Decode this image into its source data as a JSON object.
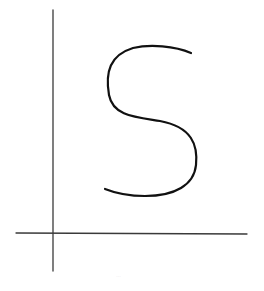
{
  "diagram": {
    "type": "sketch",
    "background": "#ffffff",
    "axes": {
      "color": "#3a3a3a",
      "stroke_width": 1.3,
      "y_axis": {
        "x1": 53,
        "y1": 10,
        "x2": 53,
        "y2": 271
      },
      "x_axis": {
        "x1": 16,
        "y1": 233,
        "x2": 247,
        "y2": 234
      }
    },
    "curve": {
      "label": "S",
      "color": "#111111",
      "stroke_width": 2.2,
      "path": "M191,53 C175,46 150,44 133,48 C110,55 105,72 109,95 C113,116 135,117 160,121 C192,127 198,145 196,165 C194,185 175,196 145,196 C128,196 115,193 105,189"
    },
    "footer_text": "…"
  }
}
